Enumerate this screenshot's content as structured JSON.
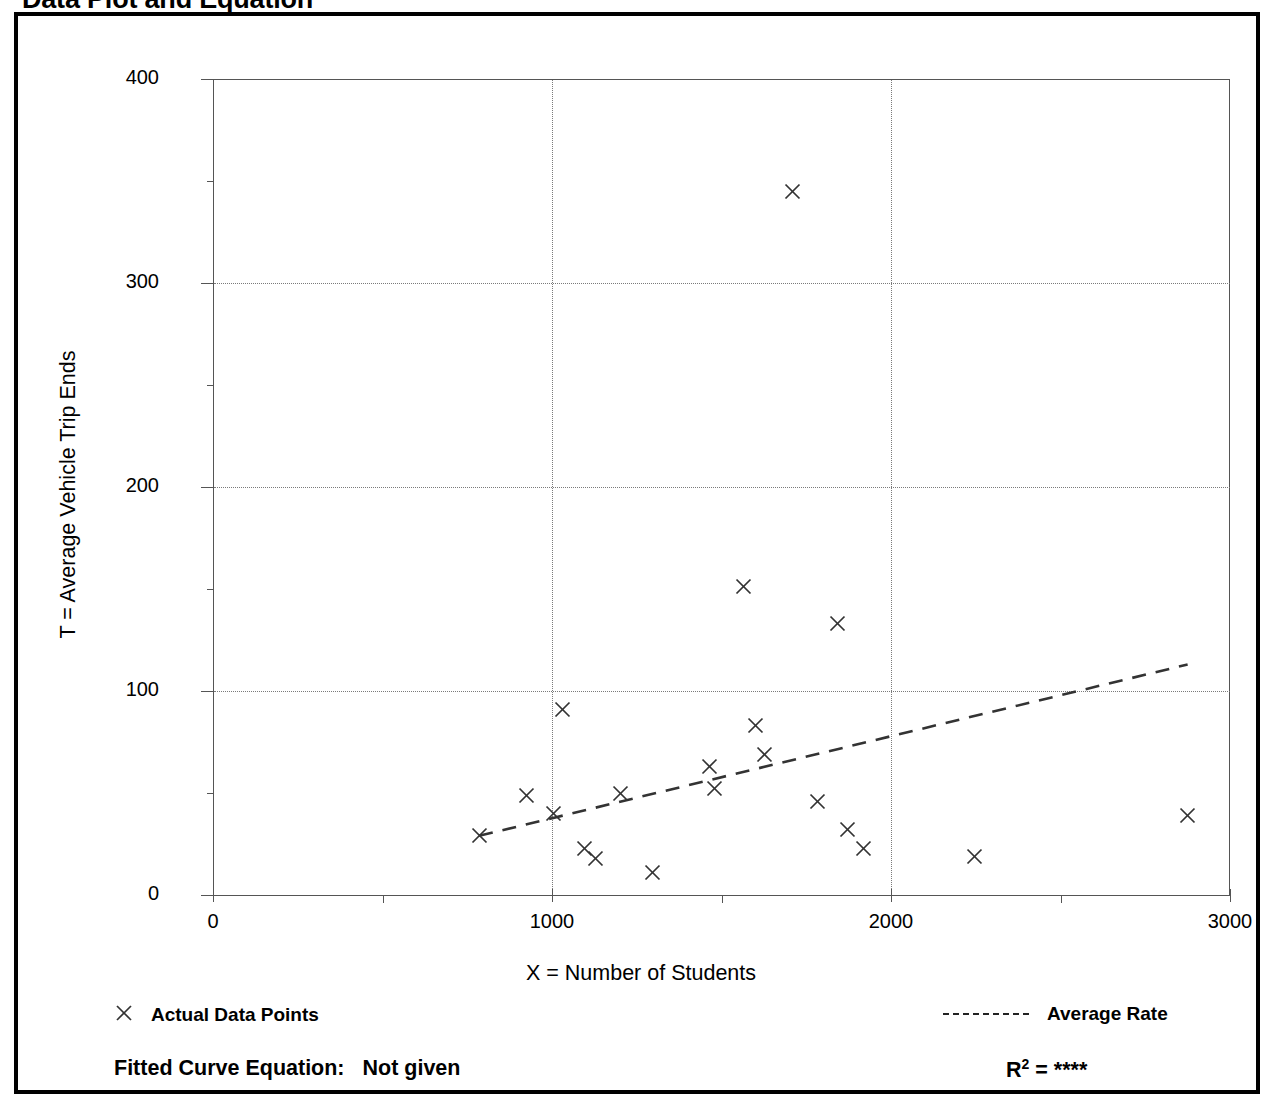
{
  "page_title": "Data Plot and Equation",
  "chart_data": {
    "type": "scatter",
    "title": "Data Plot and Equation",
    "xlabel": "X = Number of Students",
    "ylabel": "T = Average Vehicle Trip Ends",
    "xlim": [
      0,
      3000
    ],
    "ylim": [
      0,
      400
    ],
    "xticks": [
      0,
      1000,
      2000,
      3000
    ],
    "xtick_labels": [
      "0",
      "1000",
      "2000",
      "3000"
    ],
    "xticks_minor": [
      500,
      1500,
      2500
    ],
    "yticks": [
      0,
      100,
      200,
      300,
      400
    ],
    "ytick_labels": [
      "0",
      "100",
      "200",
      "300",
      "400"
    ],
    "yticks_minor": [
      50,
      150,
      250,
      350
    ],
    "grid": "dotted gridlines at y = 100, 200, 300 and x = 1000, 2000",
    "legend_position": "below axes, left and right",
    "series": [
      {
        "name": "Actual Data Points",
        "marker": "x",
        "points": [
          {
            "x": 785,
            "y": 29
          },
          {
            "x": 926,
            "y": 49
          },
          {
            "x": 1003,
            "y": 40
          },
          {
            "x": 1030,
            "y": 91
          },
          {
            "x": 1095,
            "y": 23
          },
          {
            "x": 1127,
            "y": 18
          },
          {
            "x": 1201,
            "y": 50
          },
          {
            "x": 1296,
            "y": 11
          },
          {
            "x": 1464,
            "y": 63
          },
          {
            "x": 1479,
            "y": 52
          },
          {
            "x": 1565,
            "y": 151
          },
          {
            "x": 1600,
            "y": 83
          },
          {
            "x": 1627,
            "y": 69
          },
          {
            "x": 1710,
            "y": 345
          },
          {
            "x": 1784,
            "y": 46
          },
          {
            "x": 1843,
            "y": 133
          },
          {
            "x": 1873,
            "y": 32
          },
          {
            "x": 1920,
            "y": 23
          },
          {
            "x": 2245,
            "y": 19
          },
          {
            "x": 2875,
            "y": 39
          }
        ]
      },
      {
        "name": "Average Rate",
        "marker": "dashed-line",
        "line": [
          {
            "x": 785,
            "y": 29
          },
          {
            "x": 2875,
            "y": 113
          }
        ]
      }
    ]
  },
  "legend": {
    "data_points_label": "Actual Data Points",
    "data_points_icon": "x-marker-icon",
    "average_rate_label": "Average Rate",
    "average_rate_icon": "dashed-line-icon"
  },
  "footer": {
    "fitted_curve_label": "Fitted Curve Equation:",
    "fitted_curve_value": "Not given",
    "r_squared_prefix": "R",
    "r_squared_exponent": "2",
    "r_squared_equals": "=",
    "r_squared_value": "****"
  },
  "colors": {
    "frame": "#000000",
    "axis": "#555555",
    "grid": "#7a7a7a",
    "marker": "#333333",
    "trend": "#333333",
    "background": "#ffffff"
  }
}
